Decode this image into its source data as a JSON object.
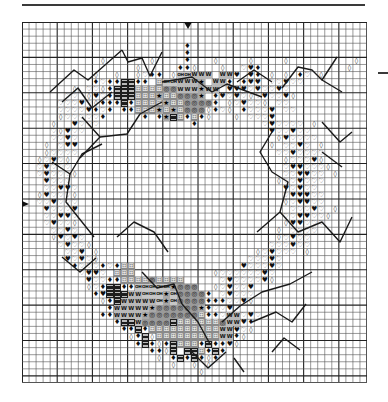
{
  "chart_title": "",
  "grid": {
    "columns": 49,
    "rows": 51,
    "bold_every": 10,
    "line_color": "#555555",
    "bold_line_color": "#222222"
  },
  "center_markers": {
    "top_column": 24,
    "left_row": 26
  },
  "symbol_key": {
    "o": {
      "name": "open-diamond",
      "glyph": "◊"
    },
    "d": {
      "name": "filled-diamond",
      "glyph": "♦"
    },
    "h": {
      "name": "filled-heart",
      "glyph": "♥"
    },
    "v": {
      "name": "open-heart",
      "glyph": "♡"
    },
    "x": {
      "name": "hourglass-block",
      "glyph": ""
    },
    "p": {
      "name": "boxed-plus",
      "glyph": "⊞"
    },
    "s": {
      "name": "star",
      "glyph": "★"
    },
    "b": {
      "name": "bullseye",
      "glyph": "◎"
    },
    "w": {
      "name": "w-letter",
      "glyph": "W"
    },
    "n": {
      "name": "oh-symbol",
      "glyph": "OH"
    }
  },
  "pattern_rows": [
    ".................................................",
    ".................................................",
    ".................................................",
    ".......................d.........................",
    ".......................d.........................",
    "...........o......o....d...o....o....o.........o.",
    "................o.....ddo...o..vhd............o..",
    "..........o..o..ovdd.onnwww.wwh.hd.o.o.dv.o......",
    "..........dvddxxdd.pnnwwws.wwd.dhh.vvhvv.........",
    ".......o.vvodxxxppppbbwwwsww.hhhvhvvhv...........",
    "......vv.ohvdxxxpppsppbbbs.dhvhvovhvvho..........",
    ".....vvvhvodddxdppppsppbbbbd.ovhvvo.vv...........",
    ".....vvvvhdvd.ddpppspspbbbodvo.dvvvh.vv..........",
    ".....ovvvvvd.....d.dsxpdpdo...o.vvvh.............",
    "....o..hvvv.............d.........vhvvvv.o.......",
    "....vohvv..........................hvvhvv.......",
    "....vvhv............................ohvvvv.......",
    "...o.vhh...........................o.vvhv.o......",
    "...ovvvv............................vvhvvvv......",
    "..ovhvo..............................ovvvho......",
    "..vhvvv..............................vhhvvvo.....",
    "..vhvvvo.............................vvhhvv.o....",
    "...hvvv.............................ovvhvvv......",
    "...vvhhv.............................hvhvv.......",
    "..ohvvvo.............................vhhhvv......",
    "..vvhvvv.............................ovhhvv......",
    "...hvvvh..............................vvvhv.o....",
    "...vvhhv.............................vvhhvvo.....",
    "...vhvvo.............................ohhvvv......",
    "....vvhv............................o.vvvv.......",
    "....ohvhv...........................ovhvv........",
    ".....vhvvo.........................vvvhvv........",
    "......vvh.o......................ovhvvv.o........",
    "......hvhvo.....................vvvhv............",
    ".......dvvvdvdpp...............hvvvhv............",
    "........vhhv.ppp...........ovvvvvvhv.............",
    ".........hvvddppppbpppp.....vhvvvvho.............",
    ".........ovdxxddnnnnnsbbb..ovhvvh................",
    "..........dhxxxwwnnnsnbbbbd.vhvvv................",
    "...........odxwwwwwnsnbbbbdddvvho................",
    "............dwwwwwsbbbbbbsdvvhv..................",
    "...........ddwwwwsbbbbbbbpddvwwvhv...............",
    ".............dxxwbbbbxppppppbwwhd................",
    "..............ddxdppppppppppwwhvo................",
    "...............odxopppppppppwwdo.................",
    "................dxdodxpppdxddho..................",
    "..................ddox.xxpdxd....................",
    "...................o.dxdxdod.....................",
    ".....................o..o.o......................",
    ".........................o.......................",
    "................................................."
  ],
  "backstitch_paths": [
    "M 28 70 L 52 48 L 66 58 L 100 28",
    "M 100 28 L 106 40 L 120 36 L 128 54 L 140 30",
    "M 40 80 L 56 66 L 70 86 L 90 70",
    "M 140 60 L 170 55 L 190 70 L 205 62 L 240 75",
    "M 215 60 L 232 48 L 250 60",
    "M 260 66 L 276 45 L 290 48 L 300 58 L 315 35",
    "M 300 58 L 320 70",
    "M 60 95 L 78 115 L 105 112 L 118 92 L 140 80",
    "M 78 115 L 58 136",
    "M 30 140 L 48 152 L 60 132 L 80 122",
    "M 48 152 L 44 180 L 60 200 L 72 215",
    "M 250 110 L 238 130 L 250 150 L 266 160 L 258 190 L 235 210",
    "M 258 190 L 276 210 L 300 200 L 318 220 L 330 195",
    "M 300 100 L 318 120 L 330 110",
    "M 300 130 L 320 145",
    "M 95 215 L 112 200 L 132 210 L 146 230",
    "M 40 235 L 58 250 L 74 236",
    "M 120 250 L 135 266 L 152 262 L 160 282",
    "M 160 282 L 176 300 L 188 322",
    "M 200 300 L 218 284 L 240 270 L 268 262 L 290 250",
    "M 230 300 L 254 290 L 270 300 L 284 282",
    "M 170 330 L 186 346 L 204 330",
    "M 212 336 L 222 350",
    "M 250 330 L 262 316 L 278 328"
  ]
}
